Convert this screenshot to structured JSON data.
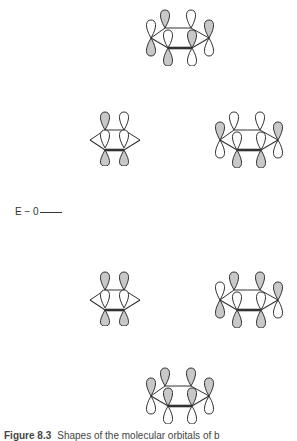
{
  "figure": {
    "caption_label": "Figure 8.3",
    "caption_text": "Shapes of the molecular orbitals of b",
    "energy_axis": {
      "label": "E − 0"
    },
    "colors": {
      "shaded_lobe": "#c8c8c8",
      "unshaded_lobe": "#ffffff",
      "outline": "#333333"
    },
    "orbitals": [
      {
        "id": "psi6",
        "level": "top",
        "x": 146,
        "y": 8,
        "upper": [
          "white",
          "gray",
          "white",
          "gray",
          "white",
          "gray"
        ],
        "lower": [
          "gray",
          "white",
          "gray",
          "white",
          "gray",
          "white"
        ]
      },
      {
        "id": "psi4",
        "level": "upper-left",
        "x": 90,
        "y": 110,
        "nodes_at_ends": true,
        "upper": [
          "none",
          "gray",
          "white",
          "none",
          "gray",
          "white"
        ],
        "lower": [
          "none",
          "white",
          "gray",
          "none",
          "white",
          "gray"
        ]
      },
      {
        "id": "psi5",
        "level": "upper-right",
        "x": 215,
        "y": 110,
        "upper": [
          "gray",
          "white",
          "white",
          "gray",
          "white",
          "white"
        ],
        "lower": [
          "white",
          "gray",
          "gray",
          "white",
          "gray",
          "gray"
        ]
      },
      {
        "id": "psi2",
        "level": "lower-left",
        "x": 90,
        "y": 270,
        "nodes_at_ends": true,
        "upper": [
          "none",
          "gray",
          "gray",
          "none",
          "gray",
          "gray"
        ],
        "lower": [
          "none",
          "gray",
          "gray",
          "none",
          "gray",
          "gray"
        ]
      },
      {
        "id": "psi3",
        "level": "lower-right",
        "x": 215,
        "y": 270,
        "upper": [
          "white",
          "gray",
          "gray",
          "gray",
          "gray",
          "gray"
        ],
        "lower": [
          "gray",
          "gray",
          "gray",
          "white",
          "white",
          "white"
        ]
      },
      {
        "id": "psi1",
        "level": "bottom",
        "x": 146,
        "y": 368,
        "upper": [
          "gray",
          "gray",
          "gray",
          "gray",
          "gray",
          "gray"
        ],
        "lower": [
          "white",
          "white",
          "white",
          "white",
          "white",
          "white"
        ]
      }
    ]
  }
}
